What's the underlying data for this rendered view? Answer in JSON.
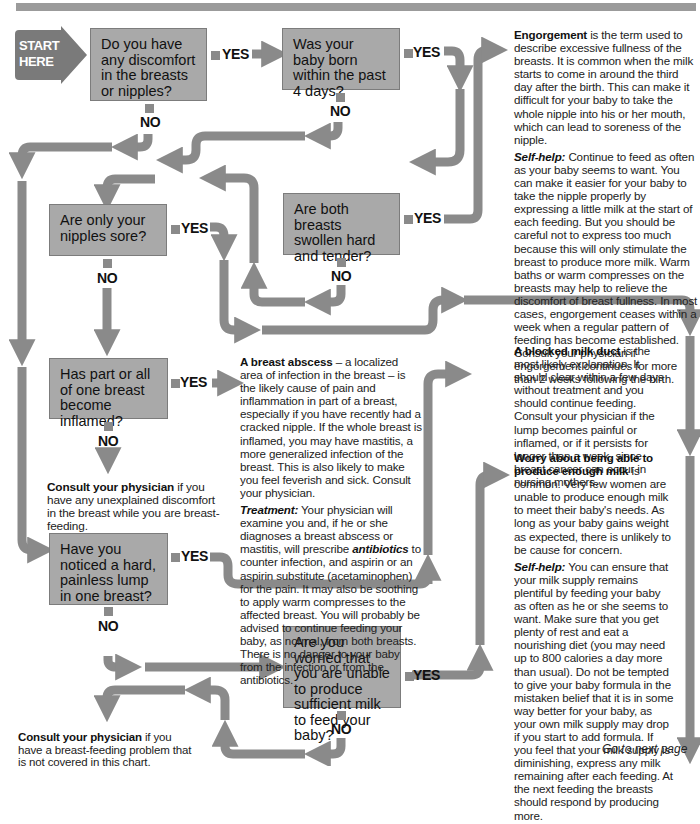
{
  "start": {
    "line1": "START",
    "line2": "HERE"
  },
  "labels": {
    "yes": "YES",
    "no": "NO"
  },
  "questions": [
    {
      "id": "q1",
      "text": "Do you have any discomfort in the breasts or nipples?"
    },
    {
      "id": "q2",
      "text": "Was your baby born within the past 4 days?"
    },
    {
      "id": "q3",
      "text": "Are both breasts swollen hard and tender?"
    },
    {
      "id": "q4",
      "text": "Are only your nipples sore?"
    },
    {
      "id": "q5",
      "text": "Has part or all of one breast become inflamed?"
    },
    {
      "id": "q6",
      "text": "Have you noticed a hard, painless lump in one breast?"
    },
    {
      "id": "q7",
      "text": "Are you worried that you are unable to produce sufficient milk to feed your baby?"
    }
  ],
  "answers": {
    "engorgement": {
      "title": "Engorgement",
      "body": " is the term used to describe excessive fullness of the breasts. It is common when the milk starts to come in around the third day after the birth. This can make it difficult for your baby to take the whole nipple into his or her mouth, which can lead to soreness of the nipple.",
      "selfhelp_label": "Self-help:",
      "selfhelp": " Continue to feed as often as your baby seems to want. You can make it easier for your baby to take the nipple properly by expressing a little milk at the start of each feeding. But you should be careful not to express too much because this will only stimulate the breast to produce more milk. Warm baths or warm compresses on the breasts may help to relieve the discomfort of breast fullness. In most cases, engorgement ceases within a week when a regular pattern of feeding has become established. Consult your physician if engorgement continues for more than 2 weeks following the birth."
    },
    "abscess": {
      "title": "A breast abscess",
      "body": " – a localized area of infection in the breast – is the likely cause of pain and inflammation in part of a breast, especially if you have recently had a cracked nipple. If the whole breast is inflamed, you may have mastitis, a more generalized infection of the breast. This is also likely to make you feel feverish and sick. Consult your physician.",
      "treatment_label": "Treatment:",
      "treatment_a": " Your physician will examine you and, if he or she diagnoses a breast abscess or mastitis, will prescribe ",
      "treatment_em": "antibiotics",
      "treatment_b": " to counter infection, and aspirin or an aspirin substitute (acetaminophen) for the pain. It may also be soothing to apply warm compresses to the affected breast. You will probably be advised to continue feeding your baby, as normal, from both breasts. There is no danger to your baby from the infection or from the antibiotics."
    },
    "blocked_duct": {
      "title": "A blocked milk duct",
      "body": " is the most likely explanation. It should clear within a few days without treatment and you should continue feeding. Consult your physician if the lump becomes painful or inflamed, or if it persists for longer than a week, since breast cancer can occur in nursing mothers."
    },
    "milk_supply": {
      "title": "Worry about being able to produce enough milk",
      "body": " is common. Very few women are unable to produce enough milk to meet their baby's needs. As long as your baby gains weight as expected, there is unlikely to be cause for concern.",
      "selfhelp_label": "Self-help:",
      "selfhelp": " You can ensure that your milk supply remains plentiful by feeding your baby as often as he or she seems to want. Make sure that you get plenty of rest and eat a nourishing diet (you may need up to 800 calories a day more than usual). Do not be tempted to give your baby formula in the mistaken belief that it is in some way better for your baby, as your own milk supply may drop if you start to add formula. If you feel that your milk supply is diminishing, express any milk remaining after each feeding. At the next feeding the breasts should respond by producing more."
    },
    "consult1": {
      "title": "Consult your physician",
      "body": " if you have any unexplained discomfort in the breast while you are breast-feeding."
    },
    "consult2": {
      "title": "Consult your physician",
      "body": " if you have a breast-feeding problem that is not covered in this chart."
    }
  },
  "footer": {
    "next": "Go to next page"
  },
  "colors": {
    "box": "#a9a9a9",
    "arrow": "#8a8a8a",
    "start": "#7a7a7a"
  }
}
